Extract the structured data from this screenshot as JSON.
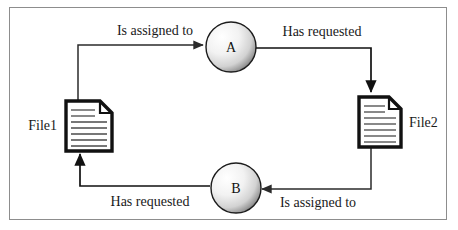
{
  "diagram": {
    "background_color": "#ffffff",
    "border_color": "#8d8d8d",
    "line_color": "#2b2b2b",
    "nodes": [
      {
        "id": "process-a",
        "label": "A",
        "shape": "circle",
        "kind": "process"
      },
      {
        "id": "process-b",
        "label": "B",
        "shape": "circle",
        "kind": "process"
      },
      {
        "id": "file1",
        "label": "File1",
        "shape": "document",
        "kind": "resource"
      },
      {
        "id": "file2",
        "label": "File2",
        "shape": "document",
        "kind": "resource"
      }
    ],
    "edges": [
      {
        "id": "file1-to-a",
        "label": "Is assigned to",
        "from": "file1",
        "to": "process-a"
      },
      {
        "id": "a-to-file2",
        "label": "Has requested",
        "from": "process-a",
        "to": "file2"
      },
      {
        "id": "file2-to-b",
        "label": "Is assigned to",
        "from": "file2",
        "to": "process-b"
      },
      {
        "id": "b-to-file1",
        "label": "Has requested",
        "from": "process-b",
        "to": "file1"
      }
    ]
  }
}
